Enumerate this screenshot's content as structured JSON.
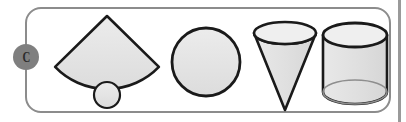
{
  "panel": {
    "name": "geometry-shapes-panel",
    "frame_color": "#8c8c8c",
    "background_color": "#ffffff",
    "right_rule_color": "#9a9a9a"
  },
  "badge": {
    "label": "C",
    "background_color": "#7f7f7f",
    "text_color": "#2b2b2b"
  },
  "shapes": {
    "fill_color": "#e3e3e3",
    "stroke_color": "#1a1a1a",
    "items": [
      {
        "name": "cone-net",
        "label": "cone net",
        "parts": [
          "circular sector",
          "circle base"
        ],
        "sector": {
          "apex_x": 107,
          "apex_y": 16,
          "radius": 72,
          "left_x": 55,
          "left_y": 66,
          "right_x": 159,
          "right_y": 66
        },
        "base_circle": {
          "cx": 107,
          "cy": 95,
          "r": 13
        }
      },
      {
        "name": "circle",
        "label": "circle",
        "cx": 206,
        "cy": 62,
        "r": 34
      },
      {
        "name": "inverted-cone",
        "label": "cone",
        "top_ellipse": {
          "cx": 285,
          "cy": 33,
          "rx": 31,
          "ry": 11
        },
        "apex_x": 285,
        "apex_y": 110
      },
      {
        "name": "cylinder",
        "label": "cylinder",
        "top_ellipse": {
          "cx": 355,
          "cy": 35,
          "rx": 32,
          "ry": 12
        },
        "bottom_ellipse": {
          "cx": 355,
          "cy": 92,
          "rx": 32,
          "ry": 12
        },
        "height": 57
      }
    ]
  }
}
